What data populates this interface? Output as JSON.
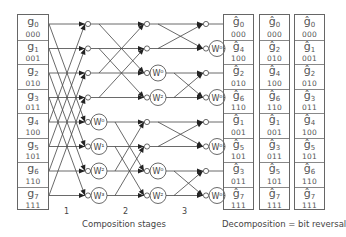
{
  "input_column": {
    "cells": [
      {
        "symbol": "g",
        "index": "0",
        "bits": "000"
      },
      {
        "symbol": "g",
        "index": "1",
        "bits": "001"
      },
      {
        "symbol": "g",
        "index": "2",
        "bits": "010"
      },
      {
        "symbol": "g",
        "index": "3",
        "bits": "011"
      },
      {
        "symbol": "g",
        "index": "4",
        "bits": "100"
      },
      {
        "symbol": "g",
        "index": "5",
        "bits": "101"
      },
      {
        "symbol": "g",
        "index": "6",
        "bits": "110"
      },
      {
        "symbol": "g",
        "index": "7",
        "bits": "111"
      }
    ]
  },
  "stages": {
    "labels": [
      "1",
      "2",
      "3"
    ],
    "caption": "Composition stages",
    "stage1_twiddles": [
      "",
      "",
      "",
      "",
      "W⁰",
      "W¹",
      "W²",
      "W³"
    ],
    "stage2_twiddles": [
      "",
      "",
      "W⁰",
      "W²",
      "",
      "",
      "W⁰",
      "W²"
    ],
    "stage3_twiddles": [
      "",
      "W⁰",
      "",
      "W⁰",
      "",
      "W⁰",
      "",
      "W⁰"
    ]
  },
  "output_columns": [
    {
      "cells": [
        {
          "symbol": "ĝ",
          "index": "0",
          "bits": "000"
        },
        {
          "symbol": "ĝ",
          "index": "4",
          "bits": "100"
        },
        {
          "symbol": "ĝ",
          "index": "2",
          "bits": "010"
        },
        {
          "symbol": "ĝ",
          "index": "6",
          "bits": "110"
        },
        {
          "symbol": "ĝ",
          "index": "1",
          "bits": "001"
        },
        {
          "symbol": "ĝ",
          "index": "5",
          "bits": "101"
        },
        {
          "symbol": "ĝ",
          "index": "3",
          "bits": "011"
        },
        {
          "symbol": "ĝ",
          "index": "7",
          "bits": "111"
        }
      ]
    },
    {
      "cells": [
        {
          "symbol": "ĝ",
          "index": "0",
          "bits": "000"
        },
        {
          "symbol": "ĝ",
          "index": "2",
          "bits": "010"
        },
        {
          "symbol": "ĝ",
          "index": "4",
          "bits": "100"
        },
        {
          "symbol": "ĝ",
          "index": "6",
          "bits": "110"
        },
        {
          "symbol": "ĝ",
          "index": "1",
          "bits": "001"
        },
        {
          "symbol": "ĝ",
          "index": "3",
          "bits": "011"
        },
        {
          "symbol": "ĝ",
          "index": "5",
          "bits": "101"
        },
        {
          "symbol": "ĝ",
          "index": "7",
          "bits": "111"
        }
      ]
    },
    {
      "cells": [
        {
          "symbol": "ĝ",
          "index": "0",
          "bits": "000"
        },
        {
          "symbol": "ĝ",
          "index": "1",
          "bits": "001"
        },
        {
          "symbol": "ĝ",
          "index": "2",
          "bits": "010"
        },
        {
          "symbol": "ĝ",
          "index": "3",
          "bits": "011"
        },
        {
          "symbol": "ĝ",
          "index": "4",
          "bits": "100"
        },
        {
          "symbol": "ĝ",
          "index": "5",
          "bits": "101"
        },
        {
          "symbol": "ĝ",
          "index": "6",
          "bits": "110"
        },
        {
          "symbol": "ĝ",
          "index": "7",
          "bits": "111"
        }
      ]
    }
  ],
  "decomposition_caption": "Decomposition = bit reversal",
  "colors": {
    "line": "#444444",
    "box_border": "#666666",
    "text": "#555555"
  }
}
